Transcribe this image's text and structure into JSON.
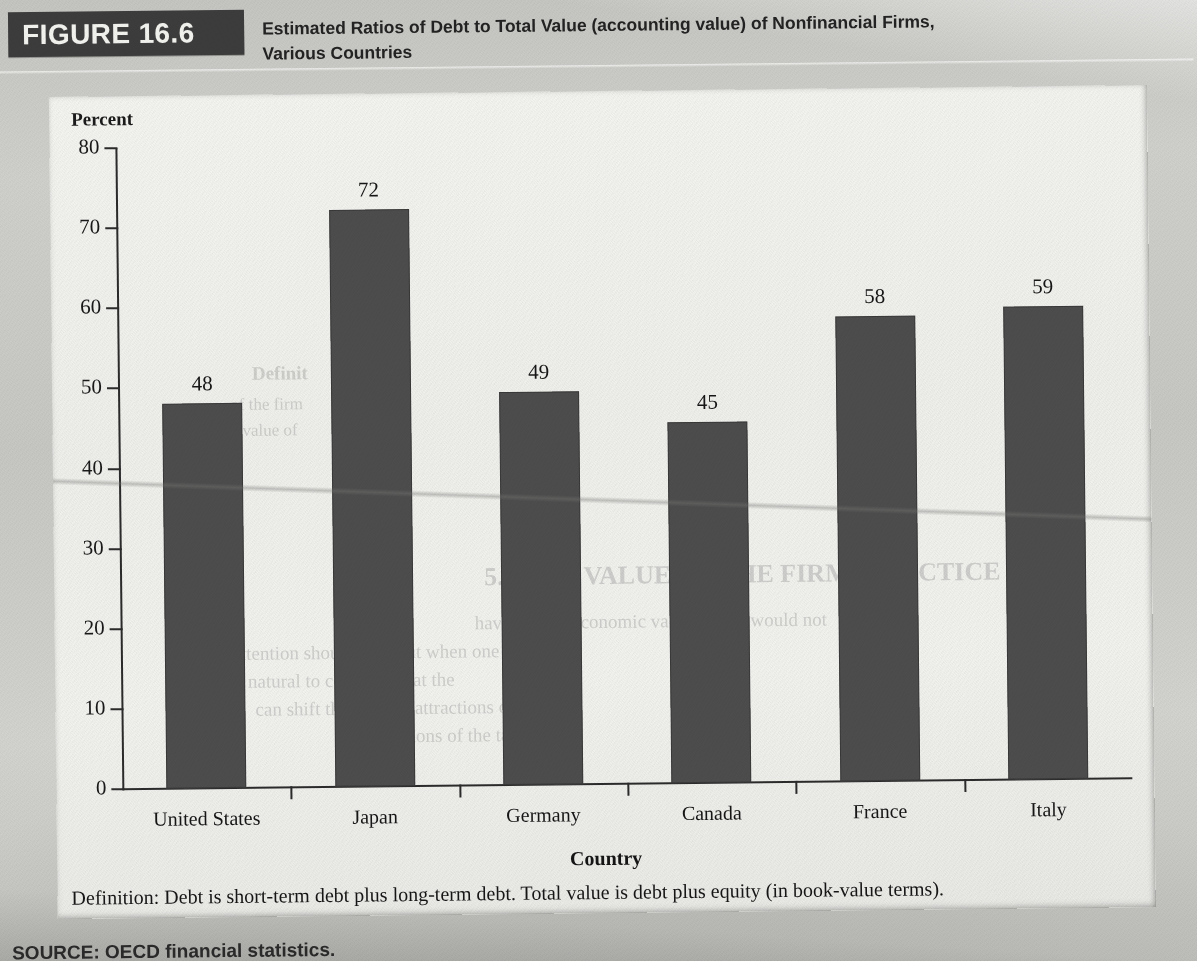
{
  "figure": {
    "badge_label": "FIGURE 16.6",
    "title_line1": "Estimated Ratios of Debt to Total Value (accounting value) of Nonfinancial Firms,",
    "title_line2": "Various Countries",
    "definition": "Definition: Debt is short-term debt plus long-term debt. Total value is debt plus equity (in book-value terms).",
    "source": "SOURCE: OECD financial statistics.",
    "badge_background": "#3c3c3c",
    "bar_color": "#4d4d4d",
    "paper_color": "#c9c9c5",
    "panel_color": "#f2f2ef"
  },
  "chart_data": {
    "type": "bar",
    "title": "Estimated Ratios of Debt to Total Value (accounting value) of Nonfinancial Firms, Various Countries",
    "categories": [
      "United States",
      "Japan",
      "Germany",
      "Canada",
      "France",
      "Italy"
    ],
    "values": [
      48,
      72,
      49,
      45,
      58,
      59
    ],
    "value_labels": [
      "48",
      "72",
      "49",
      "45",
      "58",
      "59"
    ],
    "xlabel": "Country",
    "ylabel": "Percent",
    "ylim": [
      0,
      80
    ],
    "yticks": [
      80,
      70,
      60,
      50,
      40,
      30,
      20,
      10,
      0
    ],
    "ytick_labels": [
      "80",
      "70",
      "60",
      "50",
      "40",
      "30",
      "20",
      "10",
      "0"
    ],
    "grid": false,
    "legend": null,
    "series": [
      {
        "name": "Debt to total value ratio (percent)",
        "values": [
          48,
          72,
          49,
          45,
          58,
          59
        ]
      }
    ]
  },
  "ghost_text": {
    "g1": "Definit",
    "g2": "of the firm",
    "g3": "value of",
    "g4": "5.1   THE VALUE OF THE FIRM: PRACTICE",
    "g5": "have no real economic value and so would not",
    "g6": "market attention should fall. But when one considers",
    "g7": "it is natural to conclude that the",
    "g8": "can shift the relative attractions of",
    "g9": "discussions of the tax effects"
  }
}
